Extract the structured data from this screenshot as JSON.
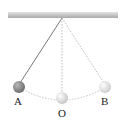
{
  "diagram": {
    "labels": {
      "left": "A",
      "center": "O",
      "right": "B"
    },
    "colors": {
      "ceiling_top": "#d8d8d8",
      "ceiling_bottom": "#a9a9a9",
      "string": "#7a7a7a",
      "dashed": "#b5b5b5",
      "ball_a": "#8a8a8a",
      "ball_o": "#dcdcdc",
      "ball_b": "#e2e2e2"
    }
  }
}
